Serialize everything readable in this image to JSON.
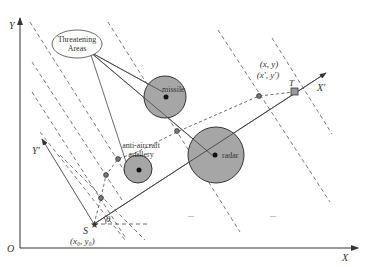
{
  "diagram": {
    "type": "path-planning coordinate diagram",
    "axes": {
      "origin_label": "O",
      "x_label": "X",
      "y_label": "Y",
      "rotated_x_label": "X'",
      "rotated_y_label": "Y'",
      "angle_label": "θ"
    },
    "points": {
      "start_label": "S",
      "start_coords": "(x₀, y₀)",
      "target_label": "T",
      "waypoint_coords_line1": "(x, y)",
      "waypoint_coords_line2": "(x', y')"
    },
    "callout": {
      "line1": "Threatening",
      "line2": "Areas"
    },
    "threats": [
      {
        "label": "missile"
      },
      {
        "label": "anti-aircraft",
        "label2": "artillery"
      },
      {
        "label": "radar"
      }
    ],
    "ellipsis": [
      "...",
      "..."
    ],
    "colors": {
      "threat_fill": "#a6a6a6",
      "threat_stroke": "#333333",
      "line": "#444444"
    }
  }
}
